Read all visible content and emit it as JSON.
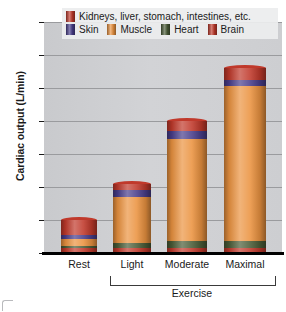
{
  "chart_data": {
    "type": "bar",
    "stacked": true,
    "title": "",
    "xlabel": "Exercise",
    "ylabel": "Cardiac output (L/min)",
    "ylim": [
      0,
      35
    ],
    "yticks": [
      0,
      5,
      10,
      15,
      20,
      25,
      30,
      35
    ],
    "grid": true,
    "legend_position": "top",
    "categories": [
      "Rest",
      "Light",
      "Moderate",
      "Maximal"
    ],
    "group_bracket": {
      "label": "Exercise",
      "spans": [
        "Light",
        "Moderate",
        "Maximal"
      ]
    },
    "series": [
      {
        "name": "Brain",
        "color": "#c0392b",
        "values": [
          0.75,
          0.75,
          0.75,
          0.75
        ]
      },
      {
        "name": "Heart",
        "color": "#4a5c37",
        "values": [
          0.25,
          0.75,
          1.0,
          1.0
        ]
      },
      {
        "name": "Muscle",
        "color": "#eb9340",
        "values": [
          1.2,
          7.0,
          15.5,
          23.5
        ]
      },
      {
        "name": "Skin",
        "color": "#483d8b",
        "values": [
          0.5,
          1.0,
          1.3,
          1.0
        ]
      },
      {
        "name": "Kidneys, liver, stomach, intestines, etc.",
        "color": "#c0392b",
        "values": [
          2.3,
          1.0,
          1.45,
          1.75
        ]
      }
    ],
    "totals": [
      5.0,
      10.5,
      20.0,
      28.0
    ]
  },
  "legend": {
    "rows": [
      [
        {
          "label": "Kidneys, liver, stomach, intestines, etc.",
          "color": "#c0392b"
        }
      ],
      [
        {
          "label": "Skin",
          "color": "#483d8b"
        },
        {
          "label": "Muscle",
          "color": "#eb9340"
        },
        {
          "label": "Heart",
          "color": "#4a5c37"
        },
        {
          "label": "Brain",
          "color": "#c0392b"
        }
      ]
    ]
  },
  "axis": {
    "y_title": "Cardiac output (L/min)",
    "y_ticks": [
      "35",
      "30",
      "25",
      "20",
      "15",
      "10",
      "5",
      "0"
    ],
    "x_labels": [
      "Rest",
      "Light",
      "Moderate",
      "Maximal"
    ],
    "bracket_label": "Exercise"
  }
}
